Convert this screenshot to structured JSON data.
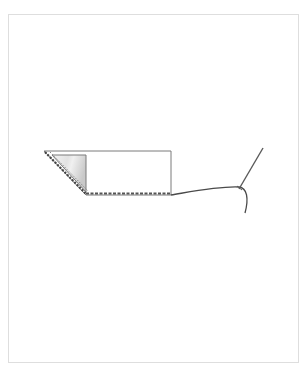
{
  "diagram": {
    "type": "sewing-instruction-illustration",
    "elements": [
      {
        "name": "fabric-rectangle",
        "shape": "rectangle"
      },
      {
        "name": "folded-corner-triangle",
        "shape": "triangle",
        "fill": "shaded-gray"
      },
      {
        "name": "stitch-line-diagonal",
        "style": "dashed"
      },
      {
        "name": "stitch-line-bottom",
        "style": "dashed"
      },
      {
        "name": "thread",
        "style": "curved-line"
      },
      {
        "name": "needle",
        "style": "line"
      }
    ],
    "colors": {
      "outline": "#6b6b6b",
      "stitch": "#555555",
      "fold_shade_light": "#f2f2f2",
      "fold_shade_dark": "#c8c8c8",
      "thread": "#4a4a4a",
      "frame_border": "#dedede"
    }
  }
}
